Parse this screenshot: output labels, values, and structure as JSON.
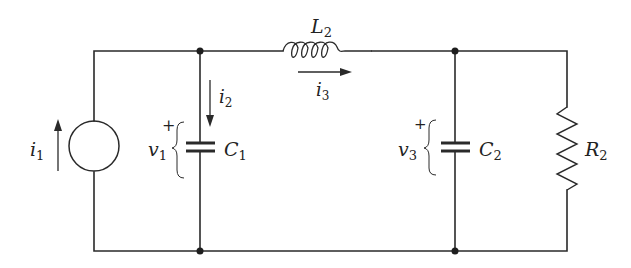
{
  "diagram": {
    "type": "circuit",
    "colors": {
      "wire": "#2a2a2a",
      "text": "#222222",
      "background": "#ffffff"
    },
    "components": [
      {
        "id": "i1",
        "kind": "current-source",
        "label": "i",
        "sub": "1"
      },
      {
        "id": "C1",
        "kind": "capacitor",
        "label": "C",
        "sub": "1"
      },
      {
        "id": "L2",
        "kind": "inductor",
        "label": "L",
        "sub": "2"
      },
      {
        "id": "C2",
        "kind": "capacitor",
        "label": "C",
        "sub": "2"
      },
      {
        "id": "R2",
        "kind": "resistor",
        "label": "R",
        "sub": "2"
      }
    ],
    "currents": [
      {
        "id": "i2",
        "label": "i",
        "sub": "2",
        "direction": "down"
      },
      {
        "id": "i3",
        "label": "i",
        "sub": "3",
        "direction": "right"
      }
    ],
    "voltages": [
      {
        "id": "v1",
        "label": "v",
        "sub": "1",
        "plus": "+"
      },
      {
        "id": "v3",
        "label": "v",
        "sub": "3",
        "plus": "+"
      }
    ]
  }
}
